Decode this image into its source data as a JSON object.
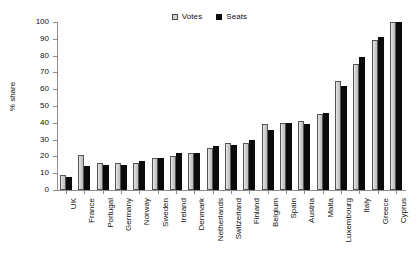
{
  "chart_data": {
    "type": "bar",
    "title": "",
    "subtitle": "",
    "xlabel": "",
    "ylabel": "% share",
    "ylim": [
      0,
      100
    ],
    "yticks": [
      0,
      10,
      20,
      30,
      40,
      50,
      60,
      70,
      80,
      90,
      100
    ],
    "grid": false,
    "legend_position": "top-center",
    "orientation": "vertical",
    "categories": [
      "UK",
      "France",
      "Portugal",
      "Germany",
      "Norway",
      "Sweden",
      "Ireland",
      "Denmark",
      "Netherlands",
      "Switzerland",
      "Finland",
      "Belgium",
      "Spain",
      "Austria",
      "Malta",
      "Luxembourg",
      "Italy",
      "Greece",
      "Cyprus"
    ],
    "series": [
      {
        "name": "Votes",
        "color": "#cfcfcf",
        "values": [
          9,
          21,
          16,
          16,
          16,
          19,
          20,
          22,
          25,
          28,
          28,
          39,
          40,
          41,
          45,
          65,
          75,
          89,
          100
        ]
      },
      {
        "name": "Seats",
        "color": "#0b0b0b",
        "values": [
          8,
          14,
          15,
          15,
          17,
          19,
          22,
          22,
          26,
          27,
          30,
          36,
          40,
          39,
          46,
          62,
          79,
          91,
          100
        ]
      }
    ]
  },
  "legend": {
    "items": [
      {
        "label": "Votes",
        "swatch": "hollow-square-icon"
      },
      {
        "label": "Seats",
        "swatch": "filled-square-icon"
      }
    ]
  },
  "axes": {
    "y": {
      "title": "% share",
      "tick_labels": [
        "0",
        "10",
        "20",
        "30",
        "40",
        "50",
        "60",
        "70",
        "80",
        "90",
        "100"
      ]
    }
  }
}
